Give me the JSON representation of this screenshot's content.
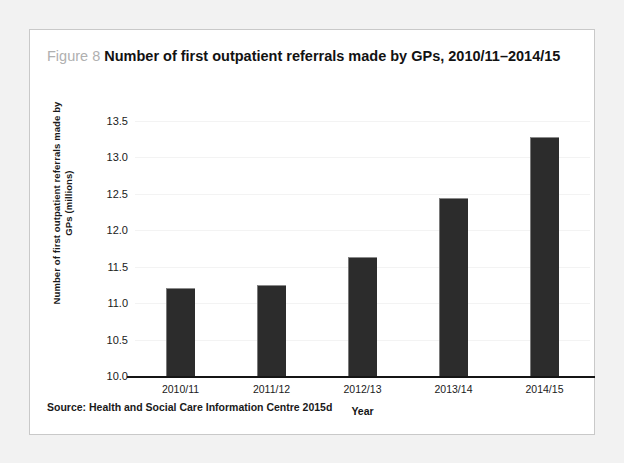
{
  "figure": {
    "number_label": "Figure 8",
    "title": "Number of first outpatient referrals made by GPs, 2010/11–2014/15",
    "source": "Source: Health and Social Care Information Centre 2015d"
  },
  "colors": {
    "page_background": "#f2f2f2",
    "card_background": "#ffffff",
    "card_border": "#c9c9c9",
    "bar_fill": "#2c2c2c",
    "axis_line": "#151515",
    "gridline": "#f3f3f3",
    "figure_number_text": "#b0b0b0",
    "title_text": "#121212"
  },
  "chart_data": {
    "type": "bar",
    "title": "Number of first outpatient referrals made by GPs, 2010/11–2014/15",
    "categories": [
      "2010/11",
      "2011/12",
      "2012/13",
      "2013/14",
      "2014/15"
    ],
    "values": [
      11.21,
      11.25,
      11.63,
      12.44,
      13.28
    ],
    "xlabel": "Year",
    "ylabel": "Number of first outpatient referrals made by GPs (millions)",
    "ylim": [
      10.0,
      13.5
    ],
    "yticks": [
      10.0,
      10.5,
      11.0,
      11.5,
      12.0,
      12.5,
      13.0,
      13.5
    ],
    "ytick_labels": [
      "10.0",
      "10.5",
      "11.0",
      "11.5",
      "12.0",
      "12.5",
      "13.0",
      "13.5"
    ],
    "grid": true,
    "legend": null,
    "series": [
      {
        "name": "First outpatient referrals made by GPs (millions)",
        "values": [
          11.21,
          11.25,
          11.63,
          12.44,
          13.28
        ]
      }
    ]
  }
}
